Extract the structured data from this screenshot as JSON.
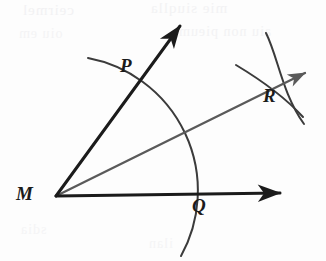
{
  "figure": {
    "canvas": {
      "width": 326,
      "height": 261,
      "background": "#fdfdfd"
    },
    "colors": {
      "ink_black": "#1b1b1b",
      "ray_gray": "#5a5a5a",
      "arc_gray": "#3b3b3b",
      "bleed": "#e9e9ec"
    },
    "vertex": {
      "name": "M",
      "x": 56,
      "y": 196
    },
    "points": [
      {
        "id": "M",
        "label": "M",
        "x": 56,
        "y": 196,
        "label_x": 16,
        "label_y": 184,
        "role": "vertex"
      },
      {
        "id": "P",
        "label": "P",
        "x": 132,
        "y": 88,
        "label_x": 120,
        "label_y": 56,
        "role": "arc-crosses-upper-ray"
      },
      {
        "id": "Q",
        "label": "Q",
        "x": 190,
        "y": 195,
        "label_x": 192,
        "label_y": 196,
        "role": "arc-crosses-lower-ray"
      },
      {
        "id": "R",
        "label": "R",
        "x": 272,
        "y": 84,
        "label_x": 263,
        "label_y": 86,
        "role": "small-arcs-intersection"
      }
    ],
    "rays": [
      {
        "id": "upper-ray",
        "from": "M",
        "tip_x": 185,
        "tip_y": 20,
        "color": "#1b1b1b",
        "width": 3.0,
        "arrow": true
      },
      {
        "id": "lower-ray",
        "from": "M",
        "tip_x": 286,
        "tip_y": 193,
        "color": "#1b1b1b",
        "width": 3.0,
        "arrow": true
      },
      {
        "id": "bisector-ray",
        "from": "M",
        "tip_x": 310,
        "tip_y": 70,
        "color": "#5a5a5a",
        "width": 2.2,
        "arrow": true
      }
    ],
    "arcs": [
      {
        "id": "main-arc",
        "center": "M",
        "radius": 135,
        "description": "arc centered at M crossing both rays at P and Q",
        "path": "M 88 58 A 135 135 0 0 1 181 256",
        "color": "#3b3b3b",
        "width": 2.0
      },
      {
        "id": "arc-from-p",
        "center": "P",
        "description": "arc centered at P crossing at R",
        "path": "M 266 33 C 279 56 282 92 304 124",
        "color": "#3b3b3b",
        "width": 2.0
      },
      {
        "id": "arc-from-q",
        "center": "Q",
        "description": "arc centered at Q crossing at R",
        "path": "M 236 65 C 255 76 283 94 303 117",
        "color": "#3b3b3b",
        "width": 2.0
      }
    ],
    "bleed_through": [
      {
        "text": "ceirmel",
        "x": 22,
        "y": 2,
        "size": 15,
        "opacity": 0.55
      },
      {
        "text": "mie siuqlla",
        "x": 150,
        "y": 0,
        "size": 15,
        "opacity": 0.5
      },
      {
        "text": "oiu em",
        "x": 18,
        "y": 26,
        "size": 14,
        "opacity": 0.45
      },
      {
        "text": "aiu non pieum",
        "x": 178,
        "y": 24,
        "size": 14,
        "opacity": 0.5
      },
      {
        "text": "sdia",
        "x": 20,
        "y": 222,
        "size": 14,
        "opacity": 0.4
      },
      {
        "text": "ilan",
        "x": 148,
        "y": 236,
        "size": 14,
        "opacity": 0.4
      }
    ]
  }
}
